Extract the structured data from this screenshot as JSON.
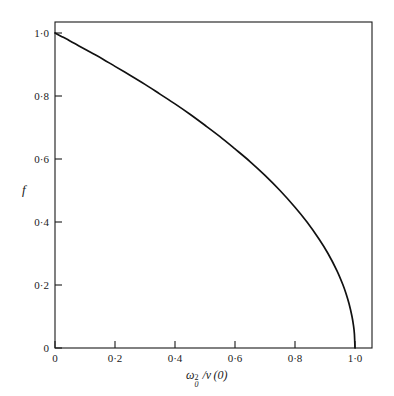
{
  "figure": {
    "background_color": "#ffffff",
    "line_color": "#111111",
    "axis_color": "#1a1a1a"
  },
  "axes": {
    "y_title": "f",
    "x_title_parts": {
      "omega": "ω",
      "subscript": "0",
      "superscript": "2",
      "divider": "/",
      "v_of_zero": "v (0)"
    },
    "x_title_plain": "ω₀²/v(0)",
    "x_ticks": [
      "0",
      "0·2",
      "0·4",
      "0·6",
      "0·8",
      "1·0"
    ],
    "x_tick_values": [
      0,
      0.2,
      0.4,
      0.6,
      0.8,
      1.0
    ],
    "y_ticks": [
      "0",
      "0·2",
      "0·4",
      "0·6",
      "0·8",
      "1·0"
    ],
    "y_tick_values": [
      0,
      0.2,
      0.4,
      0.6,
      0.8,
      1.0
    ]
  },
  "chart_data": {
    "type": "line",
    "title": "",
    "xlabel": "ω₀²/v(0)",
    "ylabel": "f",
    "xlim": [
      0,
      1.095
    ],
    "ylim": [
      0,
      1.055
    ],
    "grid": false,
    "legend": null,
    "series": [
      {
        "name": "f",
        "x": [
          0.0,
          0.02,
          0.05,
          0.08,
          0.12,
          0.16,
          0.2,
          0.25,
          0.3,
          0.35,
          0.4,
          0.45,
          0.5,
          0.55,
          0.6,
          0.65,
          0.7,
          0.75,
          0.8,
          0.84,
          0.88,
          0.91,
          0.94,
          0.96,
          0.97,
          0.98,
          0.99,
          0.995,
          0.998,
          1.0
        ],
        "y": [
          1.0,
          0.99,
          0.975,
          0.959,
          0.938,
          0.917,
          0.894,
          0.866,
          0.837,
          0.806,
          0.775,
          0.742,
          0.707,
          0.671,
          0.632,
          0.592,
          0.548,
          0.5,
          0.447,
          0.4,
          0.346,
          0.3,
          0.245,
          0.2,
          0.173,
          0.141,
          0.1,
          0.071,
          0.045,
          0.0
        ]
      }
    ],
    "annotations": []
  }
}
